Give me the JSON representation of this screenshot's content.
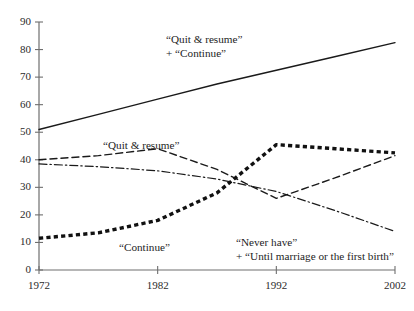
{
  "chart_data": {
    "type": "line",
    "title": "",
    "subtitle": "",
    "xlabel": "",
    "ylabel": "",
    "xlim": [
      1972,
      2002
    ],
    "ylim": [
      0,
      90
    ],
    "grid": false,
    "legend": "annotations-on-plot",
    "x": [
      1972,
      1977,
      1982,
      1987,
      1992,
      1997,
      2002
    ],
    "xticks": [
      1972,
      1982,
      1992,
      2002
    ],
    "xticklabels": [
      "1972",
      "1982",
      "1992",
      "2002"
    ],
    "yticks": [
      0,
      10,
      20,
      30,
      40,
      50,
      60,
      70,
      80,
      90
    ],
    "yticklabels": [
      "0",
      "10",
      "20",
      "30",
      "40",
      "50",
      "60",
      "70",
      "80",
      "90"
    ],
    "series": [
      {
        "name": "“Quit & resume” + “Continue”",
        "style": "solid",
        "color": "#1a1a1a",
        "width": 1.4,
        "values": [
          51,
          56.5,
          62,
          67.5,
          72.5,
          77.5,
          82.5
        ]
      },
      {
        "name": "“Quit & resume”",
        "style": "dashed",
        "color": "#1a1a1a",
        "width": 1.4,
        "values": [
          40,
          41.5,
          44,
          36.5,
          26,
          33.5,
          41.5
        ]
      },
      {
        "name": "“Never have” + “Until marriage or the first birth”",
        "style": "dash-dot",
        "color": "#1a1a1a",
        "width": 1.2,
        "values": [
          38.5,
          37.5,
          36,
          33,
          28.5,
          21.5,
          14
        ]
      },
      {
        "name": "“Continue”",
        "style": "thick-dotted",
        "color": "#111111",
        "width": 3.4,
        "values": [
          11.5,
          13.5,
          18,
          28,
          45.5,
          44,
          42.5
        ]
      }
    ],
    "annotations": [
      {
        "id": "label-quit-resume-plus-continue",
        "lines": [
          "“Quit & resume”",
          "+ “Continue”"
        ],
        "x_px": 166,
        "y_px": 32,
        "align": "left",
        "series_ref": "“Quit & resume” + “Continue”"
      },
      {
        "id": "label-quit-resume",
        "lines": [
          "“Quit & resume”"
        ],
        "x_px": 103,
        "y_px": 138,
        "align": "left",
        "series_ref": "“Quit & resume”"
      },
      {
        "id": "label-continue",
        "lines": [
          "“Continue”"
        ],
        "x_px": 119,
        "y_px": 240,
        "align": "left",
        "series_ref": "“Continue”"
      },
      {
        "id": "label-never-have",
        "lines": [
          "“Never have”",
          "+ “Until marriage or the first birth”"
        ],
        "x_px": 236,
        "y_px": 235,
        "align": "left",
        "series_ref": "“Never have” + “Until marriage or the first birth”"
      }
    ],
    "axes": {
      "axis_color": "#6e6e6e",
      "plot_left_px": 39,
      "plot_right_px": 395,
      "plot_top_px": 22,
      "plot_bottom_px": 270
    }
  }
}
